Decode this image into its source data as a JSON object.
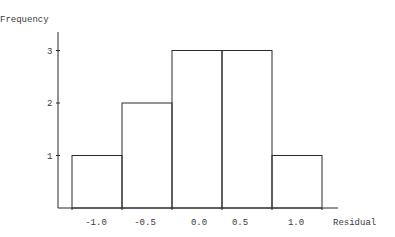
{
  "chart_data": {
    "type": "bar",
    "subtype": "histogram",
    "title": "",
    "xlabel": "Residual",
    "ylabel": "Frequency",
    "categories": [
      "-1.0",
      "-0.5",
      "0.0",
      "0.5",
      "1.0"
    ],
    "bin_edges": [
      -1.25,
      -0.75,
      -0.25,
      0.25,
      0.75,
      1.25
    ],
    "values": [
      1,
      2,
      3,
      3,
      1
    ],
    "x_tick_labels": [
      "-1.0",
      "-0.5",
      "0.0",
      "0.5",
      "1.0"
    ],
    "y_ticks": [
      1,
      2,
      3
    ],
    "y_tick_labels": [
      "1",
      "2",
      "3"
    ],
    "ylim": [
      0,
      3.5
    ],
    "grid": false,
    "legend": null
  },
  "colors": {
    "line": "#2a2a2a",
    "text": "#3a3a3a",
    "background": "#ffffff"
  }
}
